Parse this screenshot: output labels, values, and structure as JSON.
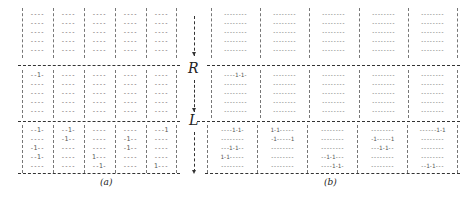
{
  "figure": {
    "panel_a": {
      "caption": "(a)",
      "sections": [
        {
          "name": "top",
          "columns": [
            [
              "----",
              "----",
              "----",
              "----",
              "----"
            ],
            [
              "----",
              "----",
              "----",
              "----",
              "----"
            ],
            [
              "----",
              "----",
              "----",
              "----",
              "----"
            ],
            [
              "----",
              "----",
              "----",
              "----",
              "----"
            ],
            [
              "----",
              "----",
              "----",
              "----",
              "----"
            ]
          ]
        },
        {
          "name": "R",
          "columns": [
            [
              "--1-",
              "----",
              "----",
              "----",
              "----"
            ],
            [
              "----",
              "----",
              "----",
              "----",
              "----"
            ],
            [
              "----",
              "----",
              "----",
              "----",
              "----"
            ],
            [
              "----",
              "----",
              "----",
              "----",
              "----"
            ],
            [
              "----",
              "----",
              "----",
              "----",
              "----"
            ]
          ]
        },
        {
          "name": "L",
          "columns": [
            [
              "--1-",
              "----",
              "-1--",
              "--1-",
              "----"
            ],
            [
              "--1-",
              "-1--",
              "----",
              "----",
              "----"
            ],
            [
              "----",
              "----",
              "----",
              "1---",
              "--1-"
            ],
            [
              "----",
              "-1--",
              "-1--",
              "----",
              "----"
            ],
            [
              "---1",
              "----",
              "----",
              "----",
              "1---"
            ]
          ]
        }
      ]
    },
    "panel_b": {
      "caption": "(b)",
      "sections": [
        {
          "name": "top",
          "columns": [
            [
              "--------",
              "--------",
              "--------",
              "--------",
              "--------"
            ],
            [
              "--------",
              "--------",
              "--------",
              "--------",
              "--------"
            ],
            [
              "--------",
              "--------",
              "--------",
              "--------",
              "--------"
            ],
            [
              "--------",
              "--------",
              "--------",
              "--------",
              "--------"
            ],
            [
              "--------",
              "--------",
              "--------",
              "--------",
              "--------"
            ]
          ]
        },
        {
          "name": "R",
          "columns": [
            [
              "----1-1-",
              "--------",
              "--------",
              "--------",
              "--------"
            ],
            [
              "--------",
              "--------",
              "--------",
              "--------",
              "--------"
            ],
            [
              "--------",
              "--------",
              "--------",
              "--------",
              "--------"
            ],
            [
              "--------",
              "--------",
              "--------",
              "--------",
              "--------"
            ],
            [
              "--------",
              "--------",
              "--------",
              "--------",
              "--------"
            ]
          ]
        },
        {
          "name": "L",
          "columns": [
            [
              "----1-1-",
              "--------",
              "---1-1--",
              "1-1-----",
              "--------"
            ],
            [
              "1-1-----",
              "-1-----1",
              "--------",
              "--------",
              "--------"
            ],
            [
              "--------",
              "--------",
              "--------",
              "--1-1---",
              "----1-1-"
            ],
            [
              "--------",
              "-1-----1",
              "---1-1--",
              "--------",
              "--------"
            ],
            [
              "------1-1",
              "--------",
              "--------",
              "--------",
              "--1-1---"
            ]
          ]
        }
      ]
    },
    "arrow": {
      "label_top": "R",
      "label_bottom": "L"
    }
  }
}
